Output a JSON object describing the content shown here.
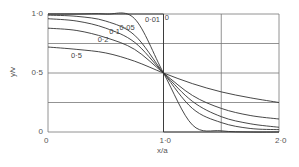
{
  "chart_data": {
    "type": "line",
    "title": "",
    "xlabel": "x/a",
    "ylabel": "y/v",
    "xlim": [
      0,
      2.0
    ],
    "ylim": [
      0,
      1.0
    ],
    "grid": true,
    "x_ticks": [
      "0",
      "1·0",
      "2·0"
    ],
    "y_ticks": [
      "0",
      "0·5",
      "1·0"
    ],
    "x": [
      0,
      0.25,
      0.5,
      0.75,
      1.0,
      1.25,
      1.5,
      1.75,
      2.0
    ],
    "series": [
      {
        "name": "0",
        "values": [
          1.0,
          1.0,
          1.0,
          1.0,
          0.5,
          0.0,
          0.0,
          0.0,
          0.0
        ]
      },
      {
        "name": "0·01",
        "values": [
          1.0,
          1.0,
          1.0,
          0.96,
          0.5,
          0.06,
          0.01,
          0.0,
          0.0
        ]
      },
      {
        "name": "0·05",
        "values": [
          0.99,
          0.98,
          0.94,
          0.82,
          0.5,
          0.2,
          0.08,
          0.03,
          0.02
        ]
      },
      {
        "name": "0·1",
        "values": [
          0.96,
          0.94,
          0.88,
          0.76,
          0.5,
          0.26,
          0.13,
          0.07,
          0.04
        ]
      },
      {
        "name": "0·2",
        "values": [
          0.88,
          0.86,
          0.8,
          0.7,
          0.5,
          0.31,
          0.2,
          0.14,
          0.11
        ]
      },
      {
        "name": "0·5",
        "values": [
          0.72,
          0.7,
          0.67,
          0.6,
          0.5,
          0.41,
          0.34,
          0.29,
          0.25
        ]
      }
    ],
    "curve_labels": [
      {
        "text": "0",
        "x": 1.01,
        "y": 0.97
      },
      {
        "text": "0·01",
        "x": 0.84,
        "y": 0.95
      },
      {
        "text": "0·05",
        "x": 0.62,
        "y": 0.88
      },
      {
        "text": "0·1",
        "x": 0.53,
        "y": 0.85
      },
      {
        "text": "0·2",
        "x": 0.43,
        "y": 0.78
      },
      {
        "text": "0·5",
        "x": 0.2,
        "y": 0.64
      }
    ]
  }
}
